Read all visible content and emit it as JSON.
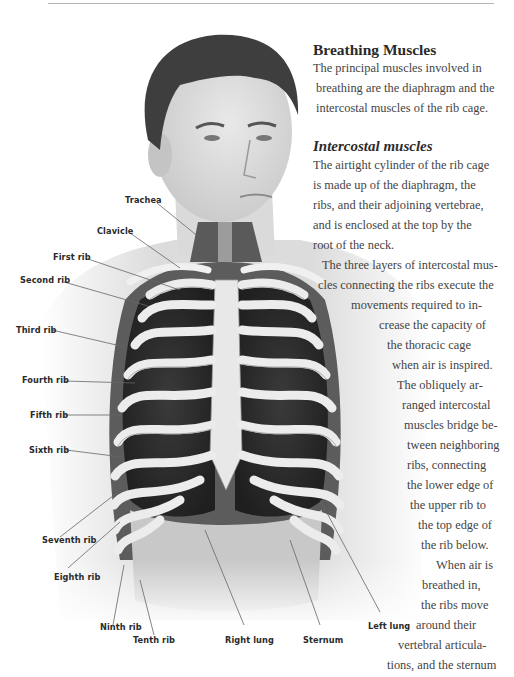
{
  "page": {
    "section_title": "Breathing Muscles",
    "intro_lines": [
      "The principal muscles involved in",
      "breathing are the diaphragm and the",
      "intercostal muscles of the rib cage."
    ],
    "subsection_title": "Intercostal muscles",
    "body_lines": [
      "The airtight cylinder of the rib cage",
      "is made up of the diaphragm, the",
      "ribs, and their adjoining vertebrae,",
      "and is enclosed at the top by the",
      "root of the neck.",
      "The three layers of intercostal mus-",
      "cles connecting the ribs execute the",
      "movements required to in-",
      "crease the capacity of",
      "the thoracic cage",
      "when air is inspired.",
      "The obliquely ar-",
      "ranged intercostal",
      "muscles bridge be-",
      "tween neighboring",
      "ribs, connecting",
      "the lower edge of",
      "the upper rib to",
      "the top edge of",
      "the rib below.",
      "When air is",
      "breathed in,",
      "the ribs move",
      "around their",
      "vertebral articula-",
      "tions, and the sternum"
    ]
  },
  "illustration": {
    "description": "Anatomical illustration of a man's head and torso with rib cage, lungs and sternum exposed",
    "labels": [
      {
        "id": "trachea",
        "text": "Trachea"
      },
      {
        "id": "clavicle",
        "text": "Clavicle"
      },
      {
        "id": "first-rib",
        "text": "First rib"
      },
      {
        "id": "second-rib",
        "text": "Second rib"
      },
      {
        "id": "third-rib",
        "text": "Third rib"
      },
      {
        "id": "fourth-rib",
        "text": "Fourth rib"
      },
      {
        "id": "fifth-rib",
        "text": "Fifth rib"
      },
      {
        "id": "sixth-rib",
        "text": "Sixth rib"
      },
      {
        "id": "seventh-rib",
        "text": "Seventh rib"
      },
      {
        "id": "eighth-rib",
        "text": "Eighth rib"
      },
      {
        "id": "ninth-rib",
        "text": "Ninth rib"
      },
      {
        "id": "tenth-rib",
        "text": "Tenth rib"
      },
      {
        "id": "right-lung",
        "text": "Right lung"
      },
      {
        "id": "sternum",
        "text": "Sternum"
      },
      {
        "id": "left-lung",
        "text": "Left lung"
      }
    ]
  },
  "colors": {
    "rule": "#b5b5b5",
    "heading": "#2b2b2b",
    "body_text": "#444444",
    "label_text": "#2a2a2a"
  }
}
